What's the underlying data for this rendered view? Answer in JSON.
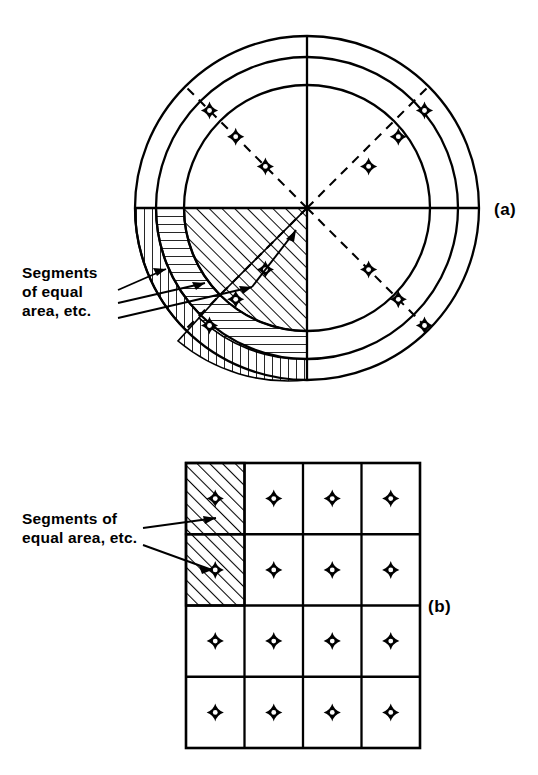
{
  "figure": {
    "title_a_label": "(a)",
    "title_b_label": "(b)",
    "panel_a": {
      "callout": {
        "line1": "Segments",
        "line2": "of equal",
        "line3": "area, etc."
      },
      "geometry": {
        "center_x": 307,
        "center_y": 208,
        "radii": [
          123,
          151,
          172
        ],
        "radius_labels": [
          "inner-circle",
          "middle-circle",
          "outer-circle"
        ],
        "solid_diameters_deg": [
          0,
          90
        ],
        "dashed_radials_deg": [
          45,
          135,
          225,
          315
        ],
        "marker_count": 12,
        "hatched_segment_count": 3
      },
      "hatch_styles": [
        "diagonal",
        "horizontal",
        "vertical"
      ],
      "markers": [
        {
          "ring": "outer",
          "angle_deg": 135
        },
        {
          "ring": "middle",
          "angle_deg": 135
        },
        {
          "ring": "inner",
          "angle_deg": 135
        },
        {
          "ring": "inner",
          "angle_deg": 45
        },
        {
          "ring": "middle",
          "angle_deg": 45
        },
        {
          "ring": "outer",
          "angle_deg": 45
        },
        {
          "ring": "inner",
          "angle_deg": 315
        },
        {
          "ring": "middle",
          "angle_deg": 315
        },
        {
          "ring": "outer",
          "angle_deg": 315
        },
        {
          "ring": "inner",
          "angle_deg": 225
        },
        {
          "ring": "middle",
          "angle_deg": 225
        },
        {
          "ring": "outer",
          "angle_deg": 225
        }
      ]
    },
    "panel_b": {
      "callout": {
        "line1": "Segments of",
        "line2": "equal area, etc."
      },
      "grid": {
        "left": 186,
        "top": 463,
        "right": 420,
        "bottom": 748,
        "columns": 4,
        "rows": 4,
        "hatched_cells": [
          {
            "row": 0,
            "col": 0
          },
          {
            "row": 1,
            "col": 0
          }
        ],
        "marker_count": 16
      }
    },
    "colors": {
      "ink": "#000000",
      "paper": "#ffffff"
    }
  }
}
